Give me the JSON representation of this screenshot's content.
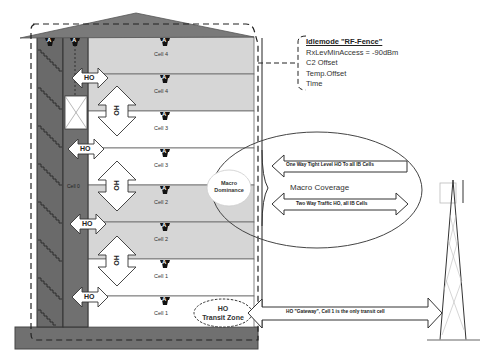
{
  "diagram": {
    "building": {
      "floors": [
        {
          "cell": "Cell 4",
          "antenna": "A",
          "shade": "gray"
        },
        {
          "cell": "Cell 4",
          "antenna": "A",
          "shade": "gray"
        },
        {
          "cell": "Cell 3",
          "antenna": "A",
          "shade": "white"
        },
        {
          "cell": "Cell 3",
          "antenna": "A",
          "shade": "white"
        },
        {
          "cell": "Cell 2",
          "antenna": "A",
          "shade": "gray"
        },
        {
          "cell": "Cell 2",
          "antenna": "A",
          "shade": "gray"
        },
        {
          "cell": "Cell 1",
          "antenna": "A",
          "shade": "white"
        },
        {
          "cell": "Cell 1",
          "antenna": "A",
          "shade": "white"
        }
      ],
      "stairwell_antennas": [
        "A",
        "A"
      ],
      "elevator_cell_label": "Cell 0",
      "ho_horizontal_labels": [
        "HO",
        "HO",
        "HO",
        "HO",
        "HO"
      ],
      "ho_vertical_labels": [
        "HO",
        "HO",
        "HO"
      ]
    },
    "idlemode_box": {
      "title": "Idlemode \"RF-Fence\"",
      "lines": [
        "RxLevMinAccess = -90dBm",
        "C2 Offset",
        "Temp.Offset",
        "Time"
      ]
    },
    "macro": {
      "coverage_label": "Macro Coverage",
      "dominance_label_1": "Macro",
      "dominance_label_2": "Dominance",
      "one_way_arrow": "One Way Tight Level HO To all IB Cells",
      "two_way_arrow": "Two Way Traffic HO,  all IB Cells"
    },
    "transit": {
      "zone_label_1": "HO",
      "zone_label_2": "Transit Zone",
      "gateway_arrow": "HO \"Gateway\", Cell 1 is the only transit cell"
    },
    "colors": {
      "wall_dark": "#6b6b6b",
      "floor_gray": "#d3d3d3",
      "floor_white": "#ffffff",
      "roof": "#7a7a7a",
      "line": "#333333"
    }
  }
}
